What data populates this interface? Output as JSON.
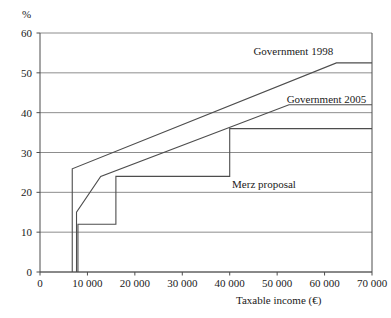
{
  "chart_data": {
    "type": "line",
    "title": "",
    "xlabel": "Taxable income (€)",
    "ylabel": "%",
    "xlim": [
      0,
      70000
    ],
    "ylim": [
      0,
      60
    ],
    "grid": "horizontal",
    "legend_position": "inline-annotations",
    "xticks": [
      "0",
      "10 000",
      "20 000",
      "30 000",
      "40 000",
      "50 000",
      "60 000",
      "70 000"
    ],
    "xtick_values": [
      0,
      10000,
      20000,
      30000,
      40000,
      50000,
      60000,
      70000
    ],
    "yticks": [
      "0",
      "10",
      "20",
      "30",
      "40",
      "50",
      "60"
    ],
    "ytick_values": [
      0,
      10,
      20,
      30,
      40,
      50,
      60
    ],
    "series": [
      {
        "name": "Government 1998",
        "points": [
          [
            6800,
            0
          ],
          [
            6800,
            25.9
          ],
          [
            62500,
            52.5
          ],
          [
            70000,
            52.5
          ]
        ]
      },
      {
        "name": "Government 2005",
        "points": [
          [
            7700,
            0
          ],
          [
            7700,
            15.0
          ],
          [
            12800,
            24.0
          ],
          [
            52500,
            42.0
          ],
          [
            70000,
            42.0
          ]
        ]
      },
      {
        "name": "Merz proposal",
        "points": [
          [
            8000,
            0
          ],
          [
            8000,
            12.0
          ],
          [
            16000,
            12.0
          ],
          [
            16000,
            24.0
          ],
          [
            40000,
            24.0
          ],
          [
            40000,
            36.0
          ],
          [
            70000,
            36.0
          ]
        ]
      }
    ],
    "annotations": [
      {
        "text": "Government 1998",
        "x": 45000,
        "y": 55.5
      },
      {
        "text": "Government 2005",
        "x": 52000,
        "y": 43.5
      },
      {
        "text": "Merz proposal",
        "x": 40500,
        "y": 22.0
      }
    ],
    "colors": {
      "line": "#4d4d4d",
      "grid": "#808080",
      "axis": "#4d4d4d",
      "background": "#ffffff",
      "text": "#1a1a1a"
    }
  }
}
